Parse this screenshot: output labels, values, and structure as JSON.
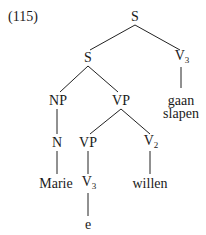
{
  "example_number": "(115)",
  "tree": {
    "root": {
      "label": "S"
    },
    "s_inner": {
      "label": "S"
    },
    "v3_top": {
      "label": "V",
      "sub": "3"
    },
    "np": {
      "label": "NP"
    },
    "vp_upper": {
      "label": "VP"
    },
    "v3_top_leaf_line1": "gaan",
    "v3_top_leaf_line2": "slapen",
    "n": {
      "label": "N"
    },
    "vp_lower": {
      "label": "VP"
    },
    "v2": {
      "label": "V",
      "sub": "2"
    },
    "n_leaf": "Marie",
    "v3_low": {
      "label": "V",
      "sub": "3"
    },
    "v2_leaf": "willen",
    "v3_low_leaf": "e"
  }
}
